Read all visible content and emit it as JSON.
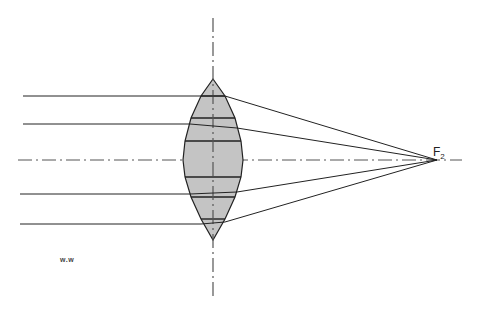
{
  "diagram": {
    "type": "converging-lens-ray-diagram",
    "colors": {
      "lens_fill": "#c4c4c4",
      "stroke": "#222222",
      "axis": "#555555",
      "background": "#ffffff"
    },
    "focal_point": {
      "label": "F",
      "subscript": "2",
      "x": 437,
      "y": 160
    },
    "signature": "w.w",
    "lens": {
      "center_x": 213,
      "top_y": 79,
      "bottom_y": 240,
      "outline": [
        [
          213,
          79
        ],
        [
          225,
          96
        ],
        [
          235,
          118
        ],
        [
          241,
          141
        ],
        [
          243,
          160
        ],
        [
          241,
          177
        ],
        [
          235,
          197
        ],
        [
          225,
          219
        ],
        [
          213,
          240
        ],
        [
          201,
          219
        ],
        [
          191,
          197
        ],
        [
          185,
          177
        ],
        [
          183,
          160
        ],
        [
          185,
          141
        ],
        [
          191,
          118
        ],
        [
          201,
          96
        ]
      ],
      "segment_ys": [
        96,
        118,
        141,
        177,
        197,
        219
      ]
    },
    "optical_axis": {
      "x1": 18,
      "x2": 462,
      "y": 160
    },
    "lens_axis": {
      "x": 213,
      "y1": 18,
      "y2": 300
    },
    "rays": [
      {
        "y": 96,
        "x_start": 23,
        "enter_x": 201,
        "exit_x": 225,
        "exit_y": 96
      },
      {
        "y": 124,
        "x_start": 23,
        "enter_x": 190,
        "exit_x": 237,
        "exit_y": 128
      },
      {
        "y": 194,
        "x_start": 20,
        "enter_x": 190,
        "exit_x": 237,
        "exit_y": 192
      },
      {
        "y": 224,
        "x_start": 20,
        "enter_x": 201,
        "exit_x": 225,
        "exit_y": 222
      }
    ]
  }
}
